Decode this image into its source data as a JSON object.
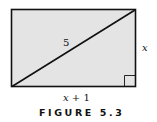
{
  "figure": {
    "diagonal_label": "5",
    "side_label": "x",
    "bottom_label_var": "x",
    "bottom_label_rest": " + 1",
    "caption": "FIGURE 5.3",
    "fill_color": "#e4e4e4",
    "stroke_color": "#111111"
  }
}
